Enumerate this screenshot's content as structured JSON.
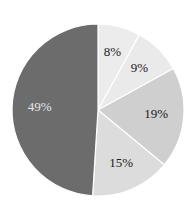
{
  "chart_data": {
    "type": "pie",
    "title": "",
    "start_angle_deg": 90,
    "direction": "clockwise",
    "categories": [
      "Slice A",
      "Slice B",
      "Slice C",
      "Slice D",
      "Slice E"
    ],
    "values": [
      8,
      9,
      19,
      15,
      49
    ],
    "labels": [
      "8%",
      "9%",
      "19%",
      "15%",
      "49%"
    ],
    "colors": [
      "#ececec",
      "#eaeaea",
      "#cfcfcf",
      "#dcdcdc",
      "#6c6c6c"
    ],
    "label_colors": [
      "#222222",
      "#222222",
      "#222222",
      "#222222",
      "#e6e6e6"
    ],
    "separator_color": "#ffffff",
    "legend": false
  }
}
